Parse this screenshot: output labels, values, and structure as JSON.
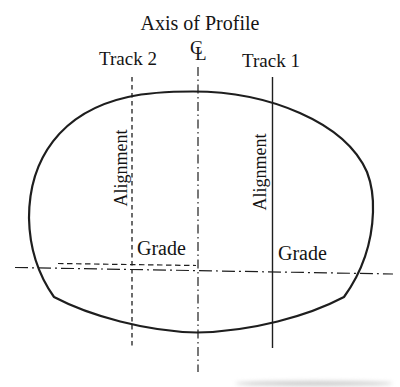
{
  "diagram": {
    "title": "Axis of Profile",
    "centerline": {
      "c": "C",
      "l": "L"
    },
    "tracks": {
      "track2_label": "Track 2",
      "track1_label": "Track 1"
    },
    "labels": {
      "alignment_left": "Alignment",
      "alignment_right": "Alignment",
      "grade_left": "Grade",
      "grade_right": "Grade"
    },
    "colors": {
      "line": "#1e1e1e",
      "text": "#141414",
      "background": "#ffffff"
    }
  }
}
